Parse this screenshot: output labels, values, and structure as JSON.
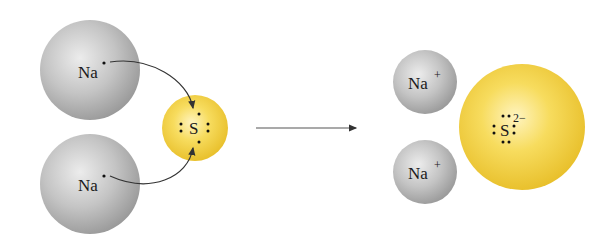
{
  "diagram": {
    "reactants": {
      "sodium_atoms": [
        {
          "symbol": "Na",
          "valence_dots": 1
        },
        {
          "symbol": "Na",
          "valence_dots": 1
        }
      ],
      "sulfur_atom": {
        "symbol": "S",
        "valence_dots": 6
      }
    },
    "products": {
      "sodium_ions": [
        {
          "symbol": "Na",
          "charge": "+"
        },
        {
          "symbol": "Na",
          "charge": "+"
        }
      ],
      "sulfide_ion": {
        "symbol": "S",
        "charge": "2−",
        "valence_dots": 8
      }
    },
    "colors": {
      "sodium": "#b8b8b8",
      "sulfur": "#f2cf3a",
      "arrow": "#333333",
      "text": "#1a1a1a"
    }
  }
}
